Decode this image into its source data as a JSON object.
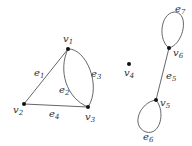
{
  "diagram": {
    "type": "graph",
    "vertices": [
      {
        "id": "v1",
        "label": "v",
        "sub": "1",
        "x": 68,
        "y": 49,
        "lx": 63,
        "ly": 42
      },
      {
        "id": "v2",
        "label": "v",
        "sub": "2",
        "x": 24,
        "y": 104,
        "lx": 13,
        "ly": 113
      },
      {
        "id": "v3",
        "label": "v",
        "sub": "3",
        "x": 88,
        "y": 107,
        "lx": 85,
        "ly": 120
      },
      {
        "id": "v4",
        "label": "v",
        "sub": "4",
        "x": 129,
        "y": 64,
        "lx": 124,
        "ly": 78
      },
      {
        "id": "v5",
        "label": "v",
        "sub": "5",
        "x": 156,
        "y": 100,
        "lx": 160,
        "ly": 107
      },
      {
        "id": "v6",
        "label": "v",
        "sub": "6",
        "x": 169,
        "y": 48,
        "lx": 173,
        "ly": 59
      }
    ],
    "edges": [
      {
        "id": "e1",
        "label": "e",
        "sub": "1",
        "from": "v1",
        "to": "v2",
        "lx": 33,
        "ly": 73
      },
      {
        "id": "e2",
        "label": "e",
        "sub": "2",
        "from": "v1",
        "to": "v3",
        "lx": 59,
        "ly": 91
      },
      {
        "id": "e3",
        "label": "e",
        "sub": "3",
        "from": "v1",
        "to": "v3",
        "lx": 90,
        "ly": 74
      },
      {
        "id": "e4",
        "label": "e",
        "sub": "4",
        "from": "v2",
        "to": "v3",
        "lx": 49,
        "ly": 116
      },
      {
        "id": "e5",
        "label": "e",
        "sub": "5",
        "from": "v5",
        "to": "v6",
        "lx": 166,
        "ly": 80
      },
      {
        "id": "e6",
        "label": "e",
        "sub": "6",
        "from": "v5",
        "to": "v5",
        "lx": 144,
        "ly": 140
      },
      {
        "id": "e7",
        "label": "e",
        "sub": "7",
        "from": "v6",
        "to": "v6",
        "lx": 176,
        "ly": 14
      }
    ]
  }
}
